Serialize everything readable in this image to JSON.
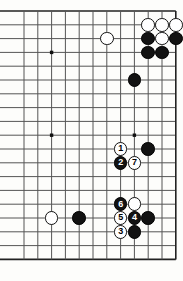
{
  "figure": {
    "kind": "go-board-diagram",
    "board_size": 19,
    "view": {
      "columns_shown": 12,
      "rows_shown": 19,
      "left_edge_is_board_edge": false,
      "right_edge_is_board_edge": true,
      "top_edge_is_board_edge": true,
      "bottom_edge_is_board_edge": true
    },
    "geometry": {
      "origin_x": 24,
      "origin_y": 11,
      "cell": 13.8,
      "stone_diameter": 13.6,
      "line_color": "#555555",
      "edge_line_color": "#222222",
      "background_color": "#fdfdfb",
      "black_color": "#121212",
      "white_color": "#ffffff"
    },
    "star_points": [
      {
        "col": 2,
        "row": 3
      },
      {
        "col": 2,
        "row": 9
      },
      {
        "col": 8,
        "row": 9
      }
    ],
    "stones": [
      {
        "id": "w-c9r1",
        "color": "white",
        "col": 9,
        "row": 1,
        "label": ""
      },
      {
        "id": "w-c10r1",
        "color": "white",
        "col": 10,
        "row": 1,
        "label": ""
      },
      {
        "id": "w-c11r1",
        "color": "white",
        "col": 11,
        "row": 1,
        "label": ""
      },
      {
        "id": "w-c6r2",
        "color": "white",
        "col": 6,
        "row": 2,
        "label": ""
      },
      {
        "id": "b-c9r2",
        "color": "black",
        "col": 9,
        "row": 2,
        "label": ""
      },
      {
        "id": "w-c10r2",
        "color": "white",
        "col": 10,
        "row": 2,
        "label": ""
      },
      {
        "id": "b-c11r2",
        "color": "black",
        "col": 11,
        "row": 2,
        "label": ""
      },
      {
        "id": "b-c9r3",
        "color": "black",
        "col": 9,
        "row": 3,
        "label": ""
      },
      {
        "id": "b-c10r3",
        "color": "black",
        "col": 10,
        "row": 3,
        "label": ""
      },
      {
        "id": "b-c8r5",
        "color": "black",
        "col": 8,
        "row": 5,
        "label": ""
      },
      {
        "id": "m1",
        "color": "white",
        "col": 7,
        "row": 10,
        "label": "1"
      },
      {
        "id": "b-c9r10",
        "color": "black",
        "col": 9,
        "row": 10,
        "label": ""
      },
      {
        "id": "m2",
        "color": "black",
        "col": 7,
        "row": 11,
        "label": "2"
      },
      {
        "id": "m7",
        "color": "white",
        "col": 8,
        "row": 11,
        "label": "7"
      },
      {
        "id": "m6",
        "color": "black",
        "col": 7,
        "row": 14,
        "label": "6"
      },
      {
        "id": "w-c8r14",
        "color": "white",
        "col": 8,
        "row": 14,
        "label": ""
      },
      {
        "id": "w-c2r15",
        "color": "white",
        "col": 2,
        "row": 15,
        "label": ""
      },
      {
        "id": "b-c4r15",
        "color": "black",
        "col": 4,
        "row": 15,
        "label": ""
      },
      {
        "id": "m5",
        "color": "white",
        "col": 7,
        "row": 15,
        "label": "5"
      },
      {
        "id": "m4",
        "color": "black",
        "col": 8,
        "row": 15,
        "label": "4"
      },
      {
        "id": "b-c9r15",
        "color": "black",
        "col": 9,
        "row": 15,
        "label": ""
      },
      {
        "id": "m3",
        "color": "white",
        "col": 7,
        "row": 16,
        "label": "3"
      },
      {
        "id": "b-c8r16",
        "color": "black",
        "col": 8,
        "row": 16,
        "label": ""
      }
    ],
    "move_sequence": [
      "1",
      "2",
      "3",
      "4",
      "5",
      "6",
      "7"
    ]
  }
}
